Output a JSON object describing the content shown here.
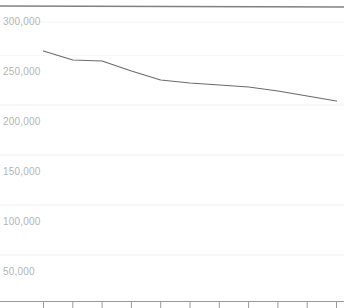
{
  "chart_data": {
    "type": "line",
    "title": "",
    "subtitle": "",
    "xlabel": "",
    "ylabel": "",
    "grid": true,
    "legend": "none",
    "ylim": [
      0,
      316000
    ],
    "y_axis_visible_range": [
      22000,
      316000
    ],
    "y_ticks": [
      300000,
      250000,
      200000,
      150000,
      100000,
      50000
    ],
    "y_tick_labels": [
      "300,000",
      "250,000",
      "200,000",
      "150,000",
      "100,000",
      "50,000"
    ],
    "x_tick_count": 11,
    "x_tick_labels": [
      "",
      "",
      "",
      "",
      "",
      "",
      "",
      "",
      "",
      "",
      ""
    ],
    "series": [
      {
        "name": "series-1",
        "color": "#6b6b6b",
        "clipped": false,
        "x": [
          0,
          1,
          2,
          3,
          4,
          5,
          6,
          7,
          8,
          9,
          10
        ],
        "values": [
          271000,
          262000,
          261000,
          251000,
          242000,
          239000,
          237000,
          235000,
          231000,
          226000,
          221000
        ]
      },
      {
        "name": "series-2-clipped-top",
        "color": "#808080",
        "clipped": true,
        "x": [
          0,
          10
        ],
        "values": [
          316000,
          315000
        ]
      }
    ],
    "annotations": []
  },
  "axis": {
    "y_labels": [
      {
        "text": "300,000"
      },
      {
        "text": "250,000"
      },
      {
        "text": "200,000"
      },
      {
        "text": "150,000"
      },
      {
        "text": "100,000"
      },
      {
        "text": "50,000"
      }
    ],
    "clipped_label": ""
  },
  "colors": {
    "background": "#ffffff",
    "gridline": "#f4f4f4",
    "axis_line": "#9a9a9a",
    "tick_mark": "#9a9a9a",
    "series_line": "#6b6b6b",
    "top_line": "#808080",
    "tick_label": "#b4b4b4"
  }
}
